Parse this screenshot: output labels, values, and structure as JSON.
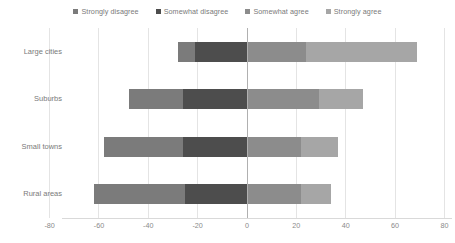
{
  "chart_data": {
    "type": "bar",
    "subtype": "diverging-stacked-bar",
    "title": "",
    "xlabel": "",
    "ylabel": "",
    "orientation": "horizontal",
    "grid": true,
    "legend_position": "top-center",
    "xlim": [
      -80,
      80
    ],
    "xticks": [
      -80,
      -60,
      -40,
      -20,
      0,
      20,
      40,
      60,
      80
    ],
    "xtick_labels": [
      "-80",
      "-60",
      "-40",
      "-20",
      "0",
      "20",
      "40",
      "60",
      "80"
    ],
    "categories": [
      "Large cities",
      "Suburbs",
      "Small towns",
      "Rural areas"
    ],
    "series": [
      {
        "name": "Strongly disagree",
        "color": "#7b7b7b",
        "side": "negative",
        "values": [
          -7,
          -22,
          -32,
          -37
        ]
      },
      {
        "name": "Somewhat disagree",
        "color": "#4d4d4d",
        "side": "negative",
        "values": [
          -21,
          -26,
          -26,
          -25
        ]
      },
      {
        "name": "Somewhat agree",
        "color": "#8c8c8c",
        "side": "positive",
        "values": [
          24,
          29,
          22,
          22
        ]
      },
      {
        "name": "Strongly agree",
        "color": "#a6a6a6",
        "side": "positive",
        "values": [
          45,
          18,
          15,
          12
        ]
      }
    ],
    "totals": {
      "negative": [
        -28,
        -48,
        -58,
        -62
      ],
      "positive": [
        69,
        47,
        37,
        34
      ]
    }
  },
  "legend": {
    "items": [
      {
        "label": "Strongly disagree",
        "color": "#7b7b7b"
      },
      {
        "label": "Somewhat disagree",
        "color": "#4d4d4d"
      },
      {
        "label": "Somewhat agree",
        "color": "#8c8c8c"
      },
      {
        "label": "Strongly agree",
        "color": "#a6a6a6"
      }
    ]
  },
  "axis": {
    "y_categories": [
      "Large cities",
      "Suburbs",
      "Small towns",
      "Rural areas"
    ],
    "x_labels": [
      "-80",
      "-60",
      "-40",
      "-20",
      "0",
      "20",
      "40",
      "60",
      "80"
    ]
  },
  "colors": {
    "gridline": "#e4e4e4",
    "zero_line": "#b0b0b0",
    "axis_line": "#d9d9d9",
    "text": "#7a7a7a",
    "background": "#ffffff"
  }
}
